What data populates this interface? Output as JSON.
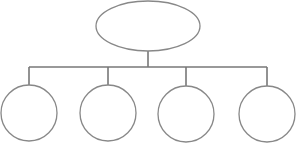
{
  "diagram": {
    "type": "hierarchy-tree",
    "stroke_color": "#888888",
    "connector_color": "#777777",
    "fill_color": "#ffffff",
    "root": {
      "shape": "ellipse",
      "label": "",
      "cx": 148,
      "cy": 26,
      "rx": 52,
      "ry": 25
    },
    "stem": {
      "x": 148,
      "y1": 51,
      "y2": 67
    },
    "bus": {
      "y": 67,
      "x1": 29,
      "x2": 267
    },
    "children": [
      {
        "shape": "circle",
        "label": "",
        "cx": 29,
        "cy": 113,
        "r": 28
      },
      {
        "shape": "circle",
        "label": "",
        "cx": 108,
        "cy": 113,
        "r": 28
      },
      {
        "shape": "circle",
        "label": "",
        "cx": 186,
        "cy": 114,
        "r": 28
      },
      {
        "shape": "circle",
        "label": "",
        "cx": 267,
        "cy": 114,
        "r": 28
      }
    ]
  }
}
